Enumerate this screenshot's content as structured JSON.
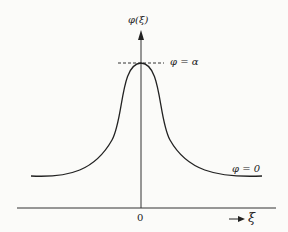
{
  "diagram": {
    "y_axis_label": "φ(ξ)",
    "peak_label": "φ = α",
    "tail_label": "φ = 0",
    "origin_label": "0",
    "x_axis_label": "ξ",
    "x_arrow": "→"
  }
}
